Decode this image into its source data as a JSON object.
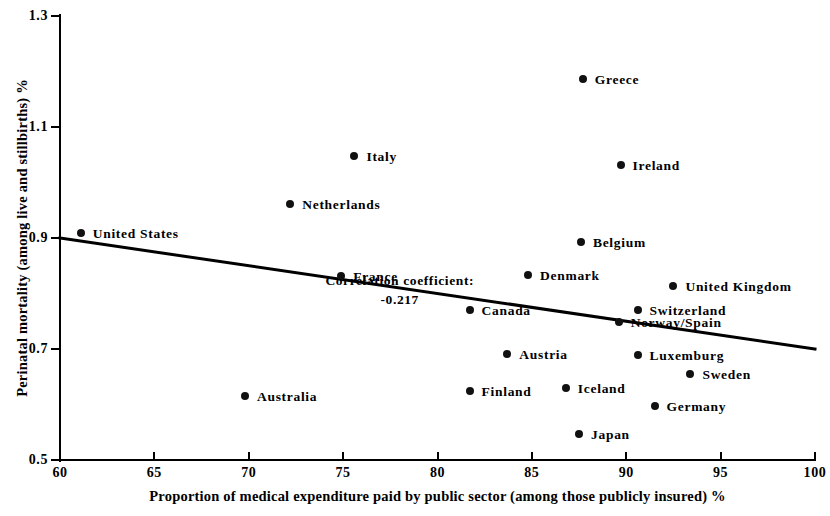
{
  "chart_data": {
    "type": "scatter",
    "title": "",
    "xlabel": "Proportion of medical expenditure paid by public sector (among those publicly insured) %",
    "ylabel": "Perinatal mortality (among live and stillbirths) %",
    "xlim": [
      60,
      100
    ],
    "ylim": [
      0.5,
      1.3
    ],
    "xticks": [
      "60",
      "65",
      "70",
      "75",
      "80",
      "85",
      "90",
      "95",
      "100"
    ],
    "xtick_values": [
      60,
      65,
      70,
      75,
      80,
      85,
      90,
      95,
      100
    ],
    "yticks": [
      "1.3",
      "1.1",
      "0.9",
      "0.7",
      "0.5"
    ],
    "ytick_values": [
      1.3,
      1.1,
      0.9,
      0.7,
      0.5
    ],
    "grid": false,
    "legend": "none",
    "marker_color": "#111111",
    "line_color": "#000000",
    "points": [
      {
        "label": "Greece",
        "x": 87.7,
        "y": 1.186,
        "label_dx": 12,
        "label_dy": 0
      },
      {
        "label": "Ireland",
        "x": 89.7,
        "y": 1.032,
        "label_dx": 12,
        "label_dy": 0
      },
      {
        "label": "Italy",
        "x": 75.6,
        "y": 1.048,
        "label_dx": 12,
        "label_dy": 0
      },
      {
        "label": "Netherlands",
        "x": 72.2,
        "y": 0.962,
        "label_dx": 12,
        "label_dy": 0
      },
      {
        "label": "Belgium",
        "x": 87.6,
        "y": 0.893,
        "label_dx": 12,
        "label_dy": 0
      },
      {
        "label": "United States",
        "x": 61.1,
        "y": 0.909,
        "label_dx": 12,
        "label_dy": 0
      },
      {
        "label": "Denmark",
        "x": 84.8,
        "y": 0.834,
        "label_dx": 12,
        "label_dy": 0
      },
      {
        "label": "France",
        "x": 74.9,
        "y": 0.832,
        "label_dx": 12,
        "label_dy": 0
      },
      {
        "label": "United Kingdom",
        "x": 92.5,
        "y": 0.813,
        "label_dx": 12,
        "label_dy": 0
      },
      {
        "label": "Switzerland",
        "x": 90.6,
        "y": 0.771,
        "label_dx": 12,
        "label_dy": 0
      },
      {
        "label": "Norway/Spain",
        "x": 89.6,
        "y": 0.748,
        "label_dx": 12,
        "label_dy": 0
      },
      {
        "label": "Canada",
        "x": 81.7,
        "y": 0.77,
        "label_dx": 12,
        "label_dy": 0
      },
      {
        "label": "Austria",
        "x": 83.7,
        "y": 0.691,
        "label_dx": 12,
        "label_dy": 0
      },
      {
        "label": "Luxemburg",
        "x": 90.6,
        "y": 0.689,
        "label_dx": 12,
        "label_dy": 0
      },
      {
        "label": "Sweden",
        "x": 93.4,
        "y": 0.655,
        "label_dx": 12,
        "label_dy": 0
      },
      {
        "label": "Iceland",
        "x": 86.8,
        "y": 0.629,
        "label_dx": 12,
        "label_dy": 0
      },
      {
        "label": "Finland",
        "x": 81.7,
        "y": 0.625,
        "label_dx": 12,
        "label_dy": 0
      },
      {
        "label": "Australia",
        "x": 69.8,
        "y": 0.616,
        "label_dx": 12,
        "label_dy": 0
      },
      {
        "label": "Germany",
        "x": 91.5,
        "y": 0.598,
        "label_dx": 12,
        "label_dy": 0
      },
      {
        "label": "Japan",
        "x": 87.5,
        "y": 0.546,
        "label_dx": 12,
        "label_dy": 0
      }
    ],
    "trend_line": {
      "x0": 60,
      "y0": 0.9,
      "x1": 100,
      "y1": 0.7
    },
    "annotations": [
      {
        "line1": "Correlation coefficient:",
        "line2": "-0.217",
        "x": 78.0,
        "y": 0.838
      }
    ]
  }
}
